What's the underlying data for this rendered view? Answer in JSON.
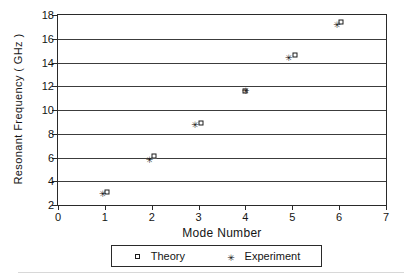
{
  "chart_data": {
    "type": "scatter",
    "title": "",
    "xlabel": "Mode Number",
    "ylabel": "Resonant Frequency ( GHz )",
    "xlim": [
      0,
      7
    ],
    "ylim": [
      2,
      18
    ],
    "xticks": [
      0,
      1,
      2,
      3,
      4,
      5,
      6,
      7
    ],
    "yticks": [
      2,
      4,
      6,
      8,
      10,
      12,
      14,
      16,
      18
    ],
    "grid": "horizontal",
    "legend_position": "below-axis",
    "x": [
      1,
      2,
      3,
      4,
      5,
      6
    ],
    "series": [
      {
        "name": "Theory",
        "marker": "open-square",
        "x": [
          1.05,
          2.05,
          3.05,
          4.0,
          5.05,
          6.05
        ],
        "values": [
          3.1,
          6.1,
          8.9,
          11.6,
          14.6,
          17.4
        ]
      },
      {
        "name": "Experiment",
        "marker": "asterisk",
        "x": [
          0.95,
          1.95,
          2.92,
          4.0,
          4.92,
          5.95
        ],
        "values": [
          2.9,
          5.8,
          8.7,
          11.6,
          14.4,
          17.2
        ]
      }
    ]
  },
  "legend": {
    "entries": [
      {
        "label": "Theory",
        "marker": "open-square-icon"
      },
      {
        "label": "Experiment",
        "marker": "asterisk-icon"
      }
    ]
  },
  "glyphs": {
    "asterisk": "✳"
  }
}
